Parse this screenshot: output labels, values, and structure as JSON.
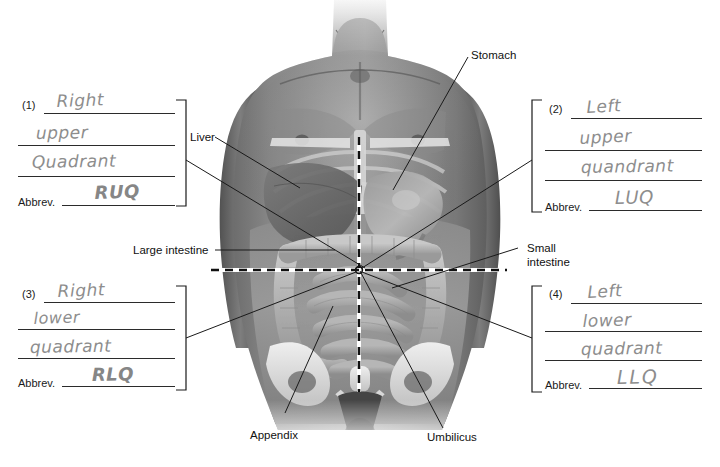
{
  "worksheet": {
    "title": "Abdominal Quadrants Labeling Worksheet",
    "abbrev_label": "Abbrev.",
    "quadrants": [
      {
        "number": "(1)",
        "position": "top-left",
        "lines": [
          "Right",
          "upper",
          "Quadrant"
        ],
        "abbrev_prompt": "Abbrev.",
        "abbrev_answer": "RUQ"
      },
      {
        "number": "(2)",
        "position": "top-right",
        "lines": [
          "Left",
          "upper",
          "quandrant"
        ],
        "abbrev_prompt": "Abbrev.",
        "abbrev_answer": "LUQ"
      },
      {
        "number": "(3)",
        "position": "bottom-left",
        "lines": [
          "Right",
          "lower",
          "quadrant"
        ],
        "abbrev_prompt": "Abbrev.",
        "abbrev_answer": "RLQ"
      },
      {
        "number": "(4)",
        "position": "bottom-right",
        "lines": [
          "Left",
          "lower",
          "quadrant"
        ],
        "abbrev_prompt": "Abbrev.",
        "abbrev_answer": "LLQ"
      }
    ]
  },
  "figure": {
    "labels": [
      {
        "id": "stomach",
        "text": "Stomach"
      },
      {
        "id": "liver",
        "text": "Liver"
      },
      {
        "id": "large-intestine",
        "text": "Large intestine"
      },
      {
        "id": "small-intestine-1",
        "text": "Small"
      },
      {
        "id": "small-intestine-2",
        "text": "intestine"
      },
      {
        "id": "appendix",
        "text": "Appendix"
      },
      {
        "id": "umbilicus",
        "text": "Umbilicus"
      }
    ]
  },
  "colors": {
    "background": "#ffffff",
    "rule_line": "#2b2b2b",
    "handwriting": "#8d8d8d",
    "label_text": "#111111",
    "leader_line": "#1a1a1a",
    "dashed_line_dark": "#111111",
    "dashed_line_light": "#ffffff"
  }
}
